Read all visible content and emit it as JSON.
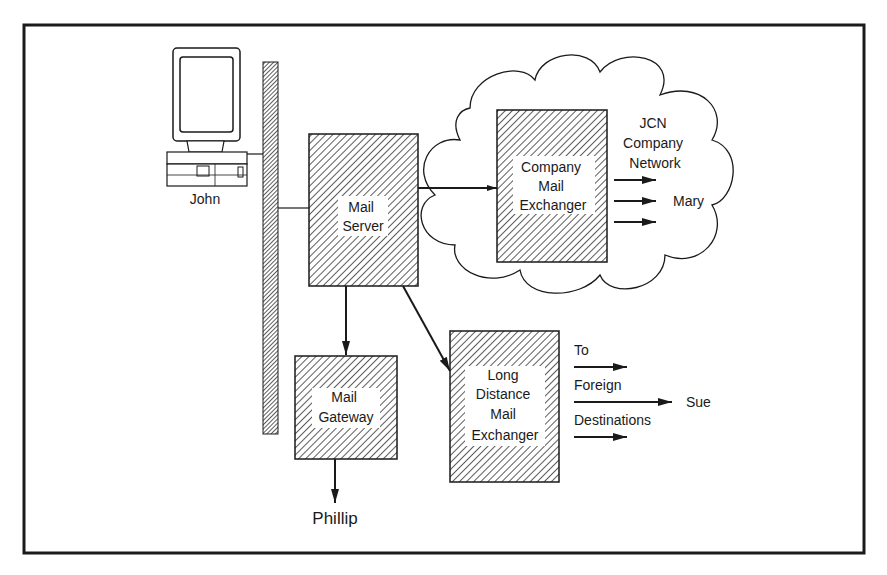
{
  "nodes": {
    "john": {
      "label": "John"
    },
    "mail_server": {
      "lines": [
        "Mail",
        "Server"
      ]
    },
    "company_mail_exchanger": {
      "lines": [
        "Company",
        "Mail",
        "Exchanger"
      ]
    },
    "mail_gateway": {
      "lines": [
        "Mail",
        "Gateway"
      ]
    },
    "long_distance_mail_exchanger": {
      "lines": [
        "Long",
        "Distance",
        "Mail",
        "Exchanger"
      ]
    }
  },
  "cloud": {
    "lines": [
      "JCN",
      "Company",
      "Network"
    ]
  },
  "recipients": {
    "mary": "Mary",
    "phillip": "Phillip",
    "sue": "Sue"
  },
  "foreign_label": {
    "lines": [
      "To",
      "Foreign",
      "Destinations"
    ]
  },
  "colors": {
    "ink": "#1a1a1a",
    "hatch": "#333333",
    "background": "#ffffff"
  }
}
